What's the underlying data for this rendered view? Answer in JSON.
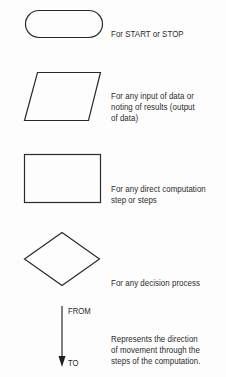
{
  "diagram": {
    "stroke_color": "#2a2a2a",
    "symbols": [
      {
        "shape": "terminator",
        "description_lines": [
          "For START or STOP"
        ]
      },
      {
        "shape": "parallelogram",
        "description_lines": [
          "For any input of data or",
          "noting of results (output",
          "of data)"
        ]
      },
      {
        "shape": "rectangle",
        "description_lines": [
          "For any direct computation",
          "step or steps"
        ]
      },
      {
        "shape": "diamond",
        "description_lines": [
          "For any decision process"
        ]
      },
      {
        "shape": "flow-arrow",
        "arrow_from_label": "FROM",
        "arrow_to_label": "TO",
        "description_lines": [
          "Represents the direction",
          "of movement through the",
          "steps of the computation."
        ]
      }
    ]
  }
}
